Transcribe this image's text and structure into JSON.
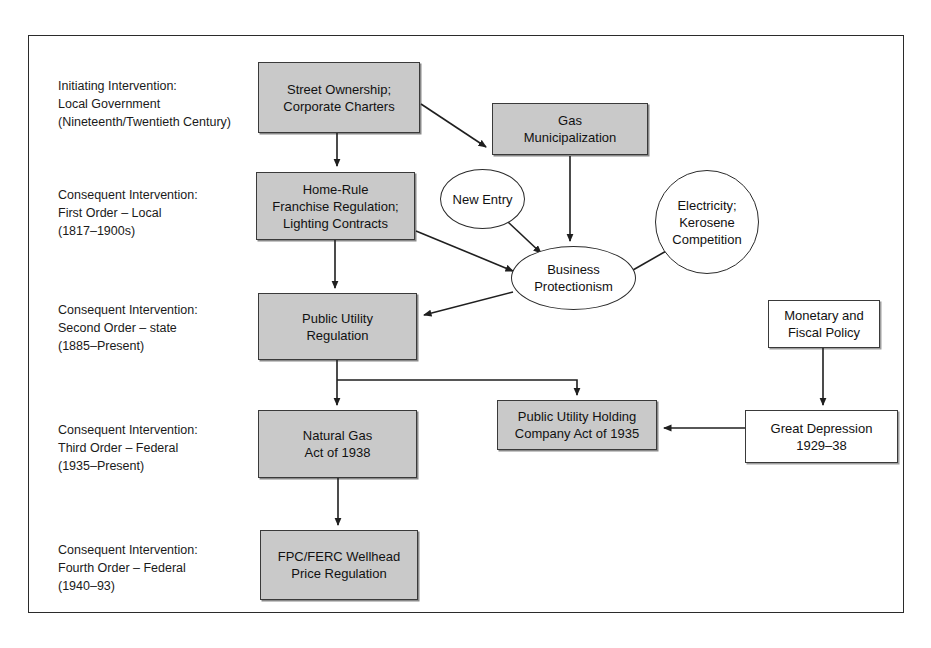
{
  "figure": {
    "type": "flowchart",
    "background": "#ffffff",
    "frame_color": "#2b2b2b",
    "shaded_fill": "#c9c9c9",
    "white_fill": "#ffffff"
  },
  "stage_labels": [
    {
      "id": "initiating",
      "text": "Initiating Intervention:\nLocal Government\n(Nineteenth/Twentieth Century)",
      "x": 58,
      "y": 77
    },
    {
      "id": "first-order",
      "text": "Consequent Intervention:\nFirst Order – Local\n(1817–1900s)",
      "x": 58,
      "y": 186
    },
    {
      "id": "second-order",
      "text": "Consequent Intervention:\nSecond Order – state\n(1885–Present)",
      "x": 58,
      "y": 301
    },
    {
      "id": "third-order",
      "text": "Consequent Intervention:\nThird Order – Federal\n(1935–Present)",
      "x": 58,
      "y": 421
    },
    {
      "id": "fourth-order",
      "text": "Consequent Intervention:\nFourth Order – Federal\n(1940–93)",
      "x": 58,
      "y": 541
    }
  ],
  "nodes": [
    {
      "id": "street-ownership",
      "label": "Street Ownership;\nCorporate Charters",
      "shape": "box",
      "fill": "shaded",
      "x": 258,
      "y": 62,
      "w": 162,
      "h": 71
    },
    {
      "id": "gas-municipalization",
      "label": "Gas\nMunicipalization",
      "shape": "box",
      "fill": "shaded",
      "x": 492,
      "y": 103,
      "w": 156,
      "h": 52
    },
    {
      "id": "home-rule",
      "label": "Home-Rule\nFranchise Regulation;\nLighting Contracts",
      "shape": "box",
      "fill": "shaded",
      "x": 256,
      "y": 172,
      "w": 159,
      "h": 68
    },
    {
      "id": "new-entry",
      "label": "New Entry",
      "shape": "ellipse",
      "fill": "white",
      "x": 440,
      "y": 169,
      "w": 85,
      "h": 60
    },
    {
      "id": "electricity-kerosene",
      "label": "Electricity;\nKerosene\nCompetition",
      "shape": "ellipse",
      "fill": "white",
      "x": 655,
      "y": 170,
      "w": 104,
      "h": 104
    },
    {
      "id": "business-protectionism",
      "label": "Business\nProtectionism",
      "shape": "ellipse",
      "fill": "white",
      "x": 511,
      "y": 246,
      "w": 125,
      "h": 64
    },
    {
      "id": "public-utility-regulation",
      "label": "Public Utility\nRegulation",
      "shape": "box",
      "fill": "shaded",
      "x": 258,
      "y": 293,
      "w": 159,
      "h": 67
    },
    {
      "id": "monetary-fiscal-policy",
      "label": "Monetary and\nFiscal Policy",
      "shape": "box",
      "fill": "white",
      "x": 768,
      "y": 300,
      "w": 112,
      "h": 48
    },
    {
      "id": "natural-gas-act",
      "label": "Natural Gas\nAct of 1938",
      "shape": "box",
      "fill": "shaded",
      "x": 258,
      "y": 410,
      "w": 159,
      "h": 68
    },
    {
      "id": "puhca",
      "label": "Public Utility Holding\nCompany Act of 1935",
      "shape": "box",
      "fill": "shaded",
      "x": 497,
      "y": 400,
      "w": 160,
      "h": 50
    },
    {
      "id": "great-depression",
      "label": "Great Depression\n1929–38",
      "shape": "box",
      "fill": "white",
      "x": 745,
      "y": 410,
      "w": 153,
      "h": 53
    },
    {
      "id": "fpc-ferc",
      "label": "FPC/FERC Wellhead\nPrice Regulation",
      "shape": "box",
      "fill": "shaded",
      "x": 260,
      "y": 530,
      "w": 158,
      "h": 70
    }
  ],
  "edges": [
    {
      "id": "street-to-home-rule",
      "from": "street-ownership",
      "to": "home-rule",
      "style": "vertical-arrow"
    },
    {
      "id": "street-to-gas-municipalization",
      "from": "street-ownership",
      "to": "gas-municipalization",
      "style": "diagonal-arrow"
    },
    {
      "id": "gas-municipalization-to-business-protectionism",
      "from": "gas-municipalization",
      "to": "business-protectionism",
      "style": "vertical-arrow"
    },
    {
      "id": "home-rule-to-public-utility-regulation",
      "from": "home-rule",
      "to": "public-utility-regulation",
      "style": "vertical-arrow"
    },
    {
      "id": "home-rule-to-business-protectionism",
      "from": "home-rule",
      "to": "business-protectionism",
      "style": "diagonal-arrow"
    },
    {
      "id": "new-entry-to-business-protectionism",
      "from": "new-entry",
      "to": "business-protectionism",
      "style": "diagonal-arrow"
    },
    {
      "id": "electricity-to-business-protectionism",
      "from": "electricity-kerosene",
      "to": "business-protectionism",
      "style": "diagonal-arrow"
    },
    {
      "id": "business-protectionism-to-public-utility-regulation",
      "from": "business-protectionism",
      "to": "public-utility-regulation",
      "style": "diagonal-arrow"
    },
    {
      "id": "public-utility-regulation-to-natural-gas-act",
      "from": "public-utility-regulation",
      "to": "natural-gas-act",
      "style": "vertical-arrow"
    },
    {
      "id": "public-utility-regulation-to-puhca",
      "from": "public-utility-regulation",
      "to": "puhca",
      "style": "elbow-arrow"
    },
    {
      "id": "monetary-fiscal-to-great-depression",
      "from": "monetary-fiscal-policy",
      "to": "great-depression",
      "style": "vertical-arrow"
    },
    {
      "id": "great-depression-to-puhca",
      "from": "great-depression",
      "to": "puhca",
      "style": "horizontal-arrow"
    },
    {
      "id": "natural-gas-act-to-fpc-ferc",
      "from": "natural-gas-act",
      "to": "fpc-ferc",
      "style": "vertical-arrow"
    }
  ]
}
